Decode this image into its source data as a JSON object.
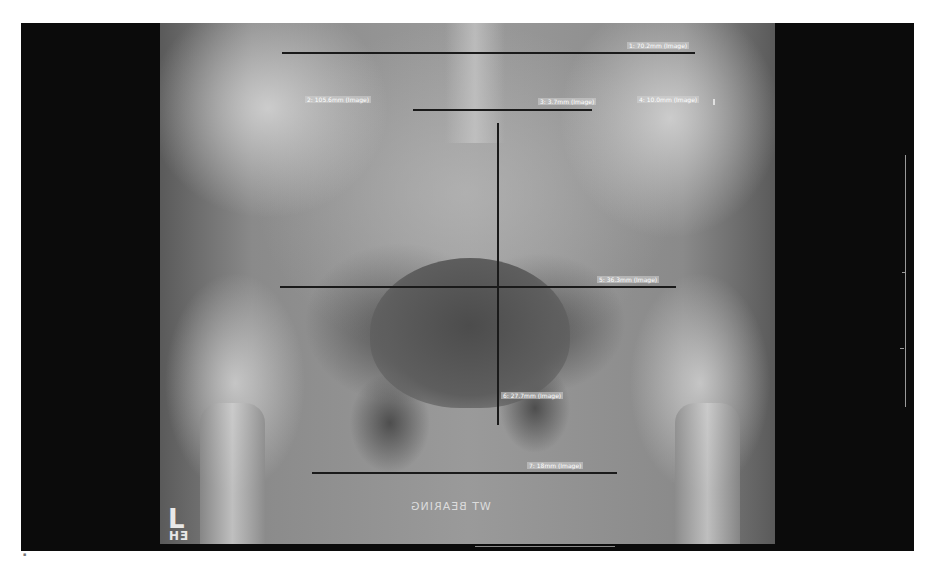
{
  "viewer": {
    "image_type": "pelvis-ap-radiograph",
    "background_color": "#0b0b0b",
    "overlay_color": "#1a1a1a",
    "label_color": "#ffffff"
  },
  "annotations": {
    "side_marker": "L",
    "tech_initials": "EH",
    "position_text": "WT BEARING"
  },
  "measurements": [
    {
      "id": 1,
      "label": "1: 70.2mm (Image)",
      "orientation": "horizontal"
    },
    {
      "id": 2,
      "label": "2: 105.6mm (Image)",
      "orientation": "label-only"
    },
    {
      "id": 3,
      "label": "3: 3.7mm (Image)",
      "orientation": "horizontal"
    },
    {
      "id": 4,
      "label": "4: 10.0mm (Image)",
      "orientation": "label-only"
    },
    {
      "id": 5,
      "label": "5: 36.3mm (Image)",
      "orientation": "horizontal"
    },
    {
      "id": 6,
      "label": "6: 27.7mm (Image)",
      "orientation": "vertical"
    },
    {
      "id": 7,
      "label": "7: 18mm (Image)",
      "orientation": "horizontal"
    }
  ]
}
